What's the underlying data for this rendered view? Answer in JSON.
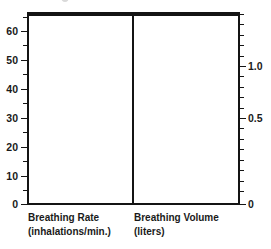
{
  "chart_data": {
    "type": "bar",
    "title": "",
    "subtitle": "",
    "panels": [
      {
        "name": "breathing-rate",
        "label": "Breathing Rate",
        "unit": "(inhalations/min.)",
        "axis_side": "left",
        "ylabel": "",
        "ylim": [
          0,
          66.5
        ],
        "ticks_major": [
          0,
          10,
          20,
          30,
          40,
          50,
          60
        ],
        "tick_labels_major": [
          "0",
          "10",
          "20",
          "30",
          "40",
          "50",
          "60"
        ],
        "ticks_minor": [
          5,
          15,
          25,
          35,
          45,
          55,
          65
        ],
        "categories": [],
        "values": []
      },
      {
        "name": "breathing-volume",
        "label": "Breathing Volume",
        "unit": "(liters)",
        "axis_side": "right",
        "ylabel": "",
        "ylim": [
          0,
          1.33
        ],
        "ticks_major": [
          0,
          0.5,
          1.0
        ],
        "tick_labels_major": [
          "0",
          "0.5",
          "1.0"
        ],
        "ticks_minor": [
          0.1,
          0.2,
          0.3,
          0.4,
          0.6,
          0.7,
          0.8,
          0.9,
          1.1,
          1.2,
          1.3
        ],
        "categories": [],
        "values": []
      }
    ],
    "grid": false,
    "legend": null,
    "frame": "box",
    "colors": {
      "axis": "#141414",
      "text": "#1a1a1a",
      "background": "#ffffff"
    },
    "note": "Empty plot frame divided into two panels; no data series drawn."
  },
  "axis_left": {
    "labels": [
      {
        "text": "60",
        "y": 31
      },
      {
        "text": "50",
        "y": 60
      },
      {
        "text": "40",
        "y": 89
      },
      {
        "text": "30",
        "y": 118
      },
      {
        "text": "20",
        "y": 147
      },
      {
        "text": "10",
        "y": 176
      },
      {
        "text": "0",
        "y": 204
      }
    ],
    "major_ticks_y": [
      31,
      60,
      89,
      118,
      147,
      176,
      204
    ],
    "minor_ticks_y": [
      17,
      45,
      74,
      103,
      132,
      161,
      190
    ]
  },
  "axis_right": {
    "labels": [
      {
        "text": "1.0",
        "y": 66
      },
      {
        "text": "0.5",
        "y": 118
      },
      {
        "text": "0",
        "y": 204
      }
    ],
    "major_ticks_y": [
      66,
      118,
      204
    ],
    "minor_ticks_y": [
      14,
      24,
      35,
      45,
      56,
      76,
      87,
      97,
      108,
      128,
      139,
      149,
      160,
      170,
      181,
      191
    ]
  },
  "captions": {
    "left": {
      "label": "Breathing Rate",
      "unit": "(inhalations/min.)"
    },
    "right": {
      "label": "Breathing Volume",
      "unit": "(liters)"
    }
  }
}
